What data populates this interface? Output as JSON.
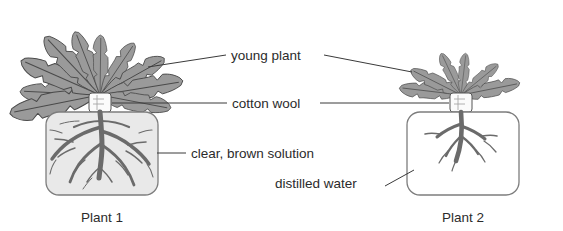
{
  "diagram": {
    "background_color": "#ffffff",
    "text_color": "#2b2b2b",
    "leader_color": "#3a3a3a",
    "labels": {
      "young_plant": "young plant",
      "cotton_wool": "cotton wool",
      "clear_brown_solution": "clear, brown solution",
      "distilled_water": "distilled water"
    },
    "captions": {
      "left": "Plant 1",
      "right": "Plant 2"
    },
    "specimens": [
      {
        "id": "plant-1",
        "caption": "Plant 1",
        "medium": "clear, brown solution",
        "medium_fill_color": "#e9e9e9",
        "beaker_outline_color": "#7d7d7d",
        "root_color": "#6b6b6b",
        "leaf_fill_color": "#9a9a9a",
        "leaf_outline_color": "#4a4a4a",
        "size_description": "large rosette, many leaves, dense root system"
      },
      {
        "id": "plant-2",
        "caption": "Plant 2",
        "medium": "distilled water",
        "medium_fill_color": "#ffffff",
        "beaker_outline_color": "#7d7d7d",
        "root_color": "#6b6b6b",
        "leaf_fill_color": "#9a9a9a",
        "leaf_outline_color": "#4a4a4a",
        "size_description": "small rosette, few leaves, sparse root system"
      }
    ]
  }
}
